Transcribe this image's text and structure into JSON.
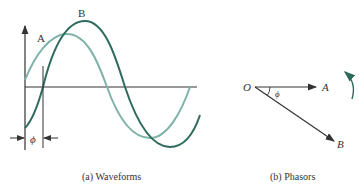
{
  "waveforms": {
    "label_a": "A",
    "label_b": "B",
    "phase_symbol": "ϕ",
    "caption": "(a) Waveforms",
    "colors": {
      "wave_a": "#7fb2a8",
      "wave_b": "#2e6b5c",
      "axis": "#333333"
    }
  },
  "phasors": {
    "origin_label": "O",
    "label_a": "A",
    "label_b": "B",
    "phase_symbol": "ϕ",
    "caption": "(b) Phasors",
    "colors": {
      "rotation_arrow": "#2e6b5c"
    }
  }
}
